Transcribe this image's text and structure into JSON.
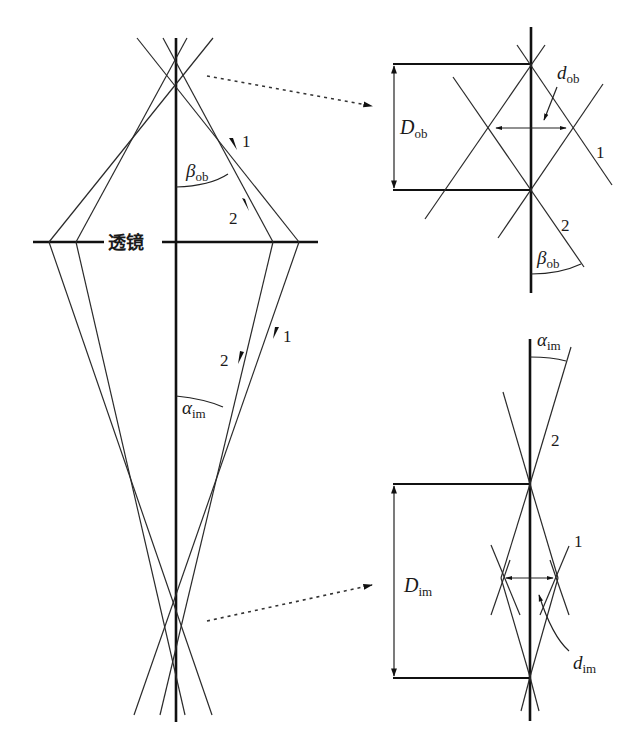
{
  "diagram": {
    "lens_label": "透镜",
    "ray_labels": {
      "ray1": "1",
      "ray2": "2"
    },
    "angles": {
      "beta_ob": {
        "symbol": "β",
        "subscript": "ob"
      },
      "alpha_im": {
        "symbol": "α",
        "subscript": "im"
      }
    },
    "object_detail": {
      "D_label": {
        "symbol": "D",
        "subscript": "ob"
      },
      "d_label": {
        "symbol": "d",
        "subscript": "ob"
      },
      "ray1": "1",
      "ray2": "2",
      "angle": {
        "symbol": "β",
        "subscript": "ob"
      }
    },
    "image_detail": {
      "D_label": {
        "symbol": "D",
        "subscript": "im"
      },
      "d_label": {
        "symbol": "d",
        "subscript": "im"
      },
      "ray1": "1",
      "ray2": "2",
      "angle": {
        "symbol": "α",
        "subscript": "im"
      }
    },
    "colors": {
      "line": "#111111",
      "background": "#ffffff"
    }
  }
}
